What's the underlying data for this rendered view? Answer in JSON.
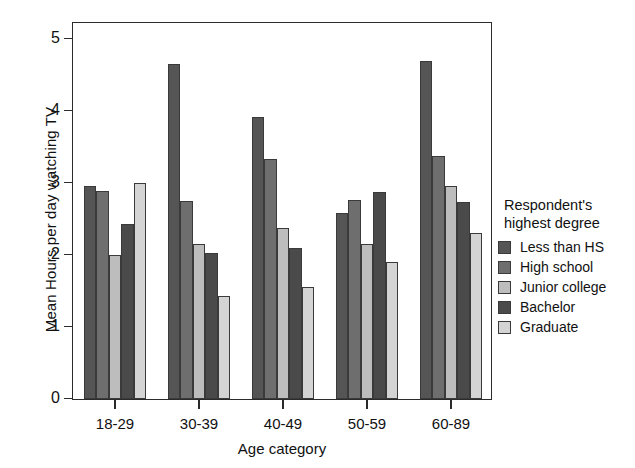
{
  "chart_data": {
    "type": "bar",
    "title": "",
    "xlabel": "Age category",
    "ylabel": "Mean Hours per day watching TV",
    "categories": [
      "18-29",
      "30-39",
      "40-49",
      "50-59",
      "60-89"
    ],
    "yticks": [
      0,
      1,
      2,
      3,
      4,
      5
    ],
    "ylim": [
      0,
      5.25
    ],
    "grid": false,
    "legend_position": "right",
    "legend_title": "Respondent's highest degree",
    "series": [
      {
        "name": "Less than HS",
        "color": "#555555",
        "values": [
          2.96,
          4.65,
          3.92,
          2.58,
          4.7
        ]
      },
      {
        "name": "High school",
        "color": "#6e6e6e",
        "values": [
          2.89,
          2.75,
          3.34,
          2.77,
          3.38
        ]
      },
      {
        "name": "Junior college",
        "color": "#bdbdbd",
        "values": [
          2.0,
          2.15,
          2.37,
          2.15,
          2.96
        ]
      },
      {
        "name": "Bachelor",
        "color": "#4a4a4a",
        "values": [
          2.43,
          2.03,
          2.1,
          2.88,
          2.73
        ]
      },
      {
        "name": "Graduate",
        "color": "#d4d4d4",
        "values": [
          3.0,
          1.43,
          1.55,
          1.9,
          2.31
        ]
      }
    ]
  },
  "legend": {
    "title_line1": "Respondent's",
    "title_line2": "highest degree"
  }
}
